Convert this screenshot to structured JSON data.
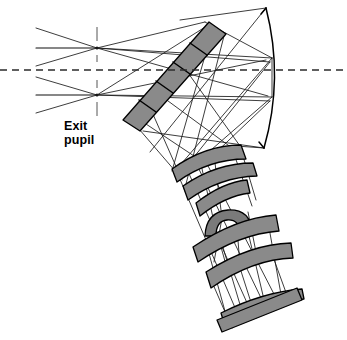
{
  "diagram": {
    "background_color": "#ffffff",
    "width": 347,
    "height": 340,
    "labels": [
      {
        "id": "exit-pupil",
        "line1": "Exit",
        "line2": "pupil",
        "x": 64,
        "y": 119,
        "font_size": 12.5,
        "bold": true,
        "color": "#000000"
      }
    ],
    "optical_axis": {
      "name": "optical-axis",
      "style": "dashed",
      "color": "#2b2b2b",
      "y": 70,
      "x_start": 0,
      "x_end": 347,
      "dash_pattern": "7 5",
      "stroke_width": 1.6
    },
    "pupil_markers": [
      {
        "name": "upper-pupil-crossing",
        "x": 97,
        "y": 48,
        "tick_top": 27,
        "tick_bottom": 62
      },
      {
        "name": "lower-pupil-crossing",
        "x": 97,
        "y": 95,
        "tick_top": 80,
        "tick_bottom": 116
      }
    ],
    "colors": {
      "element_fill": "#8a8a8a",
      "element_fill_dark": "#7a7a7a",
      "element_stroke": "#000000",
      "ray_color": "#1a1a1a",
      "axis_color": "#2b2b2b",
      "text_color": "#000000"
    },
    "elements": [
      {
        "name": "fold-mirror-corrector",
        "type": "tilted-plate",
        "description": "Large tilted plano plate / fold corrector spanning upper-right to lower-left",
        "fill": "#8a8a8a",
        "points": "209,22 226,34 140,131 123,120"
      },
      {
        "name": "primary-curved-mirror",
        "type": "curved-mirror",
        "description": "Large concave primary mirror arc on the right, bulging right",
        "stroke": "#000000",
        "path": "M 266,8 Q 283,78 264,148"
      },
      {
        "name": "lens-group-upper-element-1",
        "type": "meniscus-lens",
        "fill": "#8a8a8a",
        "path": "M 172,169 Q 205,145 241,145 L 246,159 Q 209,159 177,182 Z"
      },
      {
        "name": "lens-group-upper-element-2",
        "type": "meniscus-lens",
        "fill": "#8a8a8a",
        "path": "M 183,186 Q 216,163 253,163 L 257,176 Q 220,177 188,200 Z"
      },
      {
        "name": "lens-group-mid-element-3",
        "type": "meniscus-lens",
        "fill": "#8a8a8a",
        "path": "M 196,203 Q 223,182 247,180 L 250,193 Q 225,196 200,216 Z"
      },
      {
        "name": "lens-group-strong-curved-element",
        "type": "strong-meniscus-lens",
        "fill": "#7a7a7a",
        "path": "M 205,236 Q 206,212 228,210 Q 250,209 252,231 L 241,233 Q 239,219 227,220 Q 216,221 216,236 Z"
      },
      {
        "name": "lens-group-lower-element-4",
        "type": "meniscus-lens",
        "fill": "#8a8a8a",
        "path": "M 193,247 Q 236,218 276,215 L 279,231 Q 239,234 198,262 Z"
      },
      {
        "name": "lens-group-lower-element-5",
        "type": "meniscus-lens",
        "fill": "#8a8a8a",
        "path": "M 206,272 Q 250,244 291,243 L 293,258 Q 253,259 211,288 Z"
      },
      {
        "name": "field-flattener-plate",
        "type": "thin-curved-plate",
        "fill": "#8a8a8a",
        "path": "M 221,313 Q 263,292 302,289 L 304,299 Q 264,303 224,323 Z"
      },
      {
        "name": "image-plane-plate",
        "type": "flat-plate",
        "fill": "#8a8a8a",
        "path": "M 217,320 L 297,288 L 302,299 L 222,331 Z"
      }
    ],
    "ray_bundles": [
      {
        "name": "upper-field-bundle",
        "description": "Rays converging through upper pupil point then diverging right toward fold mirror and primary mirror"
      },
      {
        "name": "lower-field-bundle",
        "description": "Rays converging through lower pupil point then diverging right toward fold mirror and primary mirror"
      },
      {
        "name": "return-bundle",
        "description": "Rays reflected from the primary mirror back through the fold mirror down into the lens relay"
      },
      {
        "name": "relay-bundle",
        "description": "Rays traversing the tilted lens relay groups down to the image plane"
      }
    ]
  }
}
